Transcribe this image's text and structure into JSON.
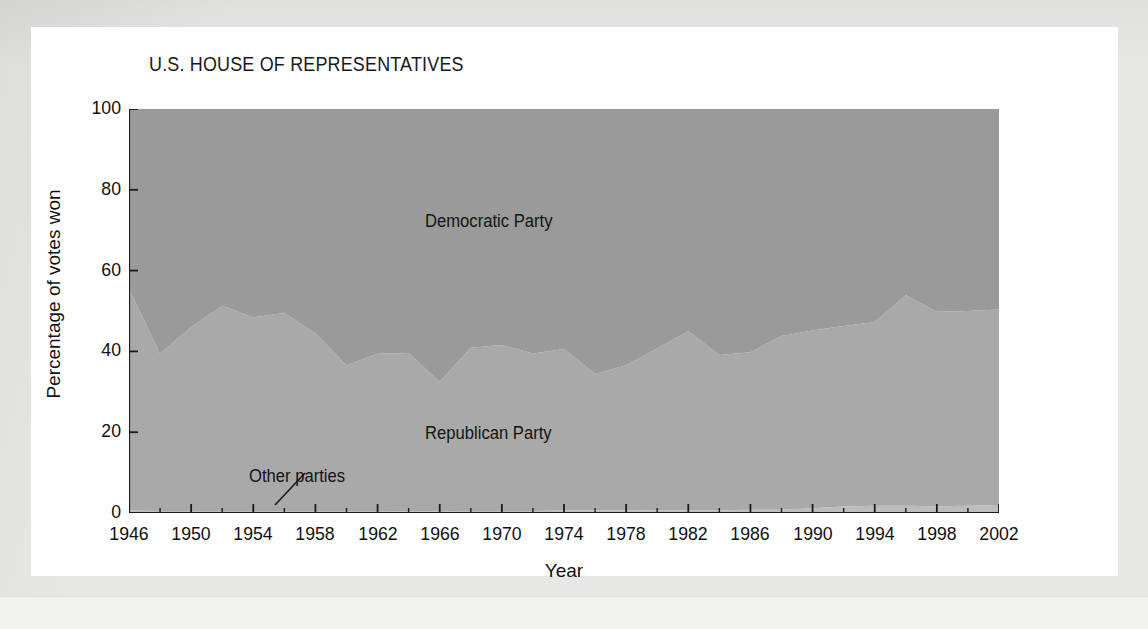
{
  "figure": {
    "title": "U.S. HOUSE OF REPRESENTATIVES",
    "xlabel": "Year",
    "ylabel": "Percentage of votes won"
  },
  "annotations": {
    "democratic": "Democratic Party",
    "republican": "Republican Party",
    "other": "Other parties"
  },
  "colors": {
    "democratic_fill": "#9a9a9a",
    "republican_fill": "#a9a9a9",
    "other_fill": "#bdbdbd",
    "axis": "#1a1a1a",
    "page_background": "#e8e8e6",
    "card_background": "#ffffff"
  },
  "chart_data": {
    "type": "area",
    "stacked": true,
    "title": "U.S. HOUSE OF REPRESENTATIVES",
    "xlabel": "Year",
    "ylabel": "Percentage of votes won",
    "xlim": [
      1946,
      2002
    ],
    "ylim": [
      0,
      100
    ],
    "grid": false,
    "legend_position": "in-plot-labels",
    "x_ticks": [
      1946,
      1950,
      1954,
      1958,
      1962,
      1966,
      1970,
      1974,
      1978,
      1982,
      1986,
      1990,
      1994,
      1998,
      2002
    ],
    "y_ticks": [
      0,
      20,
      40,
      60,
      80,
      100
    ],
    "x": [
      1946,
      1948,
      1950,
      1952,
      1954,
      1956,
      1958,
      1960,
      1962,
      1964,
      1966,
      1968,
      1970,
      1972,
      1974,
      1976,
      1978,
      1980,
      1982,
      1984,
      1986,
      1988,
      1990,
      1992,
      1994,
      1996,
      1998,
      2000,
      2002
    ],
    "series": [
      {
        "name": "Other parties",
        "values": [
          0.6,
          0.5,
          0.5,
          0.5,
          0.5,
          0.5,
          0.5,
          0.5,
          0.5,
          0.4,
          0.4,
          0.5,
          0.5,
          0.5,
          0.6,
          0.6,
          0.6,
          0.7,
          0.7,
          0.7,
          0.8,
          0.8,
          1.2,
          1.6,
          1.8,
          1.8,
          1.7,
          1.8,
          2.0
        ]
      },
      {
        "name": "Republican Party",
        "values": [
          54.9,
          38.9,
          45.5,
          50.8,
          47.9,
          49.0,
          44.0,
          36.0,
          38.9,
          39.2,
          32.0,
          40.4,
          41.1,
          39.0,
          40.0,
          33.8,
          36.0,
          40.0,
          44.3,
          38.4,
          39.0,
          43.0,
          44.0,
          44.7,
          45.5,
          52.1,
          48.1,
          48.2,
          48.4
        ]
      },
      {
        "name": "Democratic Party",
        "values": [
          44.5,
          60.6,
          54.0,
          48.7,
          51.6,
          50.5,
          55.5,
          63.5,
          60.6,
          60.4,
          67.6,
          59.1,
          58.4,
          60.5,
          59.4,
          65.6,
          63.4,
          59.3,
          55.0,
          60.9,
          60.2,
          56.2,
          54.8,
          53.7,
          52.7,
          46.1,
          50.2,
          50.0,
          49.6
        ]
      }
    ],
    "boundaries_note": "Republican share measured from 0 upward above the Other parties band; Democratic share fills to the top of the stack."
  }
}
